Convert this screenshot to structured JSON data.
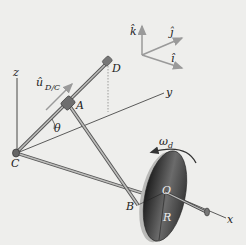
{
  "figure": {
    "type": "mechanism-diagram"
  },
  "labels": {
    "point_A": "A",
    "point_B": "B",
    "point_C": "C",
    "point_D": "D",
    "point_O": "O",
    "radius": "R",
    "angle": "θ",
    "omega": "ω",
    "omega_sub": "d",
    "unit_vector": "û",
    "unit_vector_sub": "D/C",
    "axis_x": "x",
    "axis_y": "y",
    "axis_z": "z",
    "triad_i": "î",
    "triad_j": "ĵ",
    "triad_k": "k̂"
  },
  "colors": {
    "background": "#eeeeec",
    "rod": "#8a8a88",
    "line": "#333333",
    "triad_arrow": "#9a9a9a",
    "disk_dark": "#2a2a2a",
    "disk_light": "#6a6a6a"
  }
}
